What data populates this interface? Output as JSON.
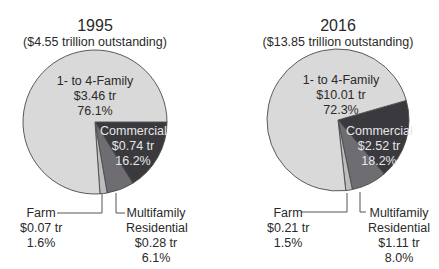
{
  "chart_data": [
    {
      "type": "pie",
      "title": "1995",
      "subtitle": "($4.55 trillion outstanding)",
      "total_trillions": 4.55,
      "slices": [
        {
          "label": "Commercial",
          "value_label": "$0.74 tr",
          "value": 0.74,
          "percent": 16.2,
          "percent_label": "16.2%",
          "color": "#3a3a3e"
        },
        {
          "label": "Multifamily Residential",
          "value_label": "$0.28 tr",
          "value": 0.28,
          "percent": 6.1,
          "percent_label": "6.1%",
          "color": "#6d6d72"
        },
        {
          "label": "Farm",
          "value_label": "$0.07 tr",
          "value": 0.07,
          "percent": 1.6,
          "percent_label": "1.6%",
          "color": "#bdbdbd"
        },
        {
          "label": "1- to 4-Family",
          "value_label": "$3.46 tr",
          "value": 3.46,
          "percent": 76.1,
          "percent_label": "76.1%",
          "color": "#d9d9d9"
        }
      ]
    },
    {
      "type": "pie",
      "title": "2016",
      "subtitle": "($13.85 trillion outstanding)",
      "total_trillions": 13.85,
      "slices": [
        {
          "label": "Commercial",
          "value_label": "$2.52 tr",
          "value": 2.52,
          "percent": 18.2,
          "percent_label": "18.2%",
          "color": "#3a3a3e"
        },
        {
          "label": "Multifamily Residential",
          "value_label": "$1.11 tr",
          "value": 1.11,
          "percent": 8.0,
          "percent_label": "8.0%",
          "color": "#6d6d72"
        },
        {
          "label": "Farm",
          "value_label": "$0.21 tr",
          "value": 0.21,
          "percent": 1.5,
          "percent_label": "1.5%",
          "color": "#bdbdbd"
        },
        {
          "label": "1- to 4-Family",
          "value_label": "$10.01 tr",
          "value": 10.01,
          "percent": 72.3,
          "percent_label": "72.3%",
          "color": "#d9d9d9"
        }
      ]
    }
  ],
  "labels": {
    "left": {
      "year": "1995",
      "outstanding": "($4.55 trillion outstanding)",
      "family": {
        "name": "1- to 4-Family",
        "value": "$3.46 tr",
        "pct": "76.1%"
      },
      "commercial": {
        "name": "Commercial",
        "value": "$0.74 tr",
        "pct": "16.2%"
      },
      "farm": {
        "name": "Farm",
        "value": "$0.07 tr",
        "pct": "1.6%"
      },
      "multifamily": {
        "name1": "Multifamily",
        "name2": "Residential",
        "value": "$0.28 tr",
        "pct": "6.1%"
      }
    },
    "right": {
      "year": "2016",
      "outstanding": "($13.85 trillion outstanding)",
      "family": {
        "name": "1- to 4-Family",
        "value": "$10.01 tr",
        "pct": "72.3%"
      },
      "commercial": {
        "name": "Commercial",
        "value": "$2.52 tr",
        "pct": "18.2%"
      },
      "farm": {
        "name": "Farm",
        "value": "$0.21 tr",
        "pct": "1.5%"
      },
      "multifamily": {
        "name1": "Multifamily",
        "name2": "Residential",
        "value": "$1.11 tr",
        "pct": "8.0%"
      }
    }
  }
}
